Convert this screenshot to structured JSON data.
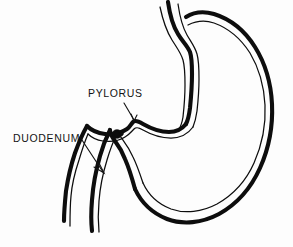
{
  "figure": {
    "kind": "anatomical-line-drawing",
    "background_color": "#fdfdfd",
    "ink_color": "#0d0d0d"
  },
  "labels": {
    "pylorus": "PYLORUS",
    "duodenum": "DUODENUM"
  },
  "annotations": {
    "pylorus_leader": "leader-line-pointing-down-right-to-pyloric-notch",
    "duodenum_leader": "arrow-pointing-down-right-to-duodenal-wall",
    "lesion": "dark-ulcer-spot-on-duodenal-bulb"
  },
  "structures": {
    "esophagus": "esophagus",
    "fundus": "fundus",
    "body": "body-of-stomach",
    "greater_curvature": "greater-curvature",
    "lesser_curvature": "lesser-curvature",
    "antrum": "antrum",
    "pylorus": "pylorus",
    "duodenum": "duodenum"
  }
}
